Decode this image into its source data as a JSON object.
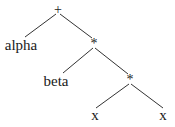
{
  "diagram": {
    "type": "expression-tree",
    "line_color": "#333333",
    "nodes": [
      {
        "id": "n0",
        "label": "+",
        "x": 58,
        "y": 10,
        "kind": "op"
      },
      {
        "id": "n1",
        "label": "alpha",
        "x": 21,
        "y": 45,
        "kind": "leaf"
      },
      {
        "id": "n2",
        "label": "*",
        "x": 94,
        "y": 43,
        "kind": "op"
      },
      {
        "id": "n3",
        "label": "beta",
        "x": 56,
        "y": 81,
        "kind": "leaf"
      },
      {
        "id": "n4",
        "label": "*",
        "x": 130,
        "y": 79,
        "kind": "op"
      },
      {
        "id": "n5",
        "label": "x",
        "x": 95,
        "y": 116,
        "kind": "leaf"
      },
      {
        "id": "n6",
        "label": "x",
        "x": 163,
        "y": 116,
        "kind": "leaf"
      }
    ],
    "edges": [
      {
        "from": "n0",
        "to": "n1"
      },
      {
        "from": "n0",
        "to": "n2"
      },
      {
        "from": "n2",
        "to": "n3"
      },
      {
        "from": "n2",
        "to": "n4"
      },
      {
        "from": "n4",
        "to": "n5"
      },
      {
        "from": "n4",
        "to": "n6"
      }
    ]
  }
}
